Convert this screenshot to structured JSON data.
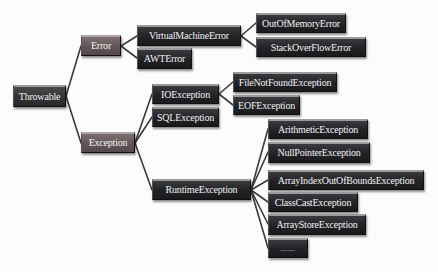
{
  "diagram": {
    "type": "tree",
    "title": "",
    "colors": {
      "root": "#333336",
      "level1": "#635557",
      "other": "#222226",
      "line": "#3a3a3a",
      "text": "#f2f2f2",
      "background": "#fcfcfc"
    },
    "nodes": {
      "throwable": "Throwable",
      "error": "Error",
      "exception": "Exception",
      "virtual_machine_error": "VirtualMachineError",
      "awt_error": "AWTError",
      "out_of_memory_error": "OutOfMemoryError",
      "stack_over_flow_error": "StackOverFlowError",
      "io_exception": "IOException",
      "sql_exception": "SQLException",
      "file_not_found_exception": "FileNotFoundException",
      "eof_exception": "EOFException",
      "runtime_exception": "RuntimeException",
      "arithmetic_exception": "ArithmeticException",
      "null_pointer_exception": "NullPointerException",
      "array_index_out_of_bounds_exception": "ArrayIndexOutOfBoundsException",
      "class_cast_exception": "ClassCastException",
      "array_store_exception": "ArrayStoreException",
      "more": "……"
    },
    "edges": [
      [
        "Throwable",
        "Error"
      ],
      [
        "Throwable",
        "Exception"
      ],
      [
        "Error",
        "VirtualMachineError"
      ],
      [
        "Error",
        "AWTError"
      ],
      [
        "VirtualMachineError",
        "OutOfMemoryError"
      ],
      [
        "VirtualMachineError",
        "StackOverFlowError"
      ],
      [
        "Exception",
        "IOException"
      ],
      [
        "Exception",
        "SQLException"
      ],
      [
        "Exception",
        "RuntimeException"
      ],
      [
        "IOException",
        "FileNotFoundException"
      ],
      [
        "IOException",
        "EOFException"
      ],
      [
        "RuntimeException",
        "ArithmeticException"
      ],
      [
        "RuntimeException",
        "NullPointerException"
      ],
      [
        "RuntimeException",
        "ArrayIndexOutOfBoundsException"
      ],
      [
        "RuntimeException",
        "ClassCastException"
      ],
      [
        "RuntimeException",
        "ArrayStoreException"
      ],
      [
        "RuntimeException",
        "……"
      ]
    ]
  }
}
